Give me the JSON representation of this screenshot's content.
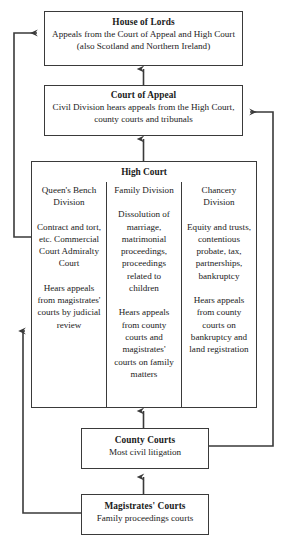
{
  "diagram": {
    "line_color": "#3a3a3a",
    "background": "#ffffff"
  },
  "boxes": {
    "house_of_lords": {
      "title": "House of Lords",
      "subtitle": "Appeals from the Court of Appeal and High Court (also Scotland and Northern Ireland)"
    },
    "court_of_appeal": {
      "title": "Court of Appeal",
      "subtitle": "Civil Division hears appeals from the High Court, county courts and tribunals"
    },
    "high_court": {
      "title": "High Court",
      "columns": [
        {
          "name": "Queen's Bench Division",
          "scope": "Contract and tort, etc. Commercial Court Admiralty Court",
          "appeals": "Hears appeals from magistrates' courts by judicial review"
        },
        {
          "name": "Family Division",
          "scope": "Dissolution of marriage, matrimonial proceedings, proceedings related to children",
          "appeals": "Hears appeals from county courts and magistrates' courts on family matters"
        },
        {
          "name": "Chancery Division",
          "scope": "Equity and trusts, contentious probate, tax, partnerships, bankruptcy",
          "appeals": "Hears appeals from county courts on bankruptcy and land registration"
        }
      ]
    },
    "county_courts": {
      "title": "County Courts",
      "subtitle": "Most civil litigation"
    },
    "magistrates_courts": {
      "title": "Magistrates' Courts",
      "subtitle": "Family proceedings courts"
    }
  },
  "connectors": [
    {
      "name": "high-court-to-court-of-appeal",
      "from": "High Court",
      "to": "Court of Appeal",
      "direction": "up"
    },
    {
      "name": "court-of-appeal-to-house-of-lords",
      "from": "Court of Appeal",
      "to": "House of Lords",
      "direction": "up"
    },
    {
      "name": "high-court-to-house-of-lords",
      "from": "High Court",
      "to": "House of Lords",
      "direction": "up-left"
    },
    {
      "name": "magistrates-courts-to-high-court",
      "from": "Magistrates' Courts",
      "to": "High Court",
      "direction": "up-left"
    },
    {
      "name": "county-courts-to-high-court",
      "from": "County Courts",
      "to": "High Court",
      "direction": "up"
    },
    {
      "name": "county-courts-to-court-of-appeal",
      "from": "County Courts",
      "to": "Court of Appeal",
      "direction": "up-right"
    },
    {
      "name": "magistrates-courts-to-county-courts",
      "from": "Magistrates' Courts",
      "to": "County Courts",
      "direction": "up"
    }
  ]
}
